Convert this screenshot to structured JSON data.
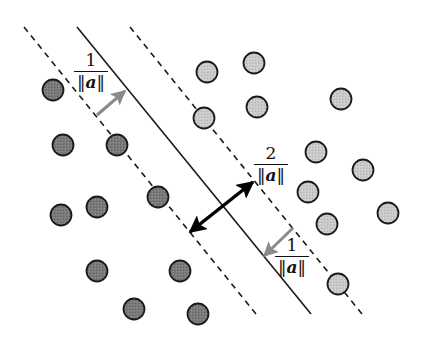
{
  "diagram": {
    "colors": {
      "class_a_fill": "#7a7a7a",
      "class_b_fill": "#c9c9c9",
      "stroke": "#1a1a1a",
      "small_arrow": "#8a8a8a",
      "margin_arrow": "#000000"
    },
    "lines": {
      "hyperplane": {
        "x1": 77,
        "y1": 27,
        "x2": 311,
        "y2": 314,
        "style": "solid"
      },
      "margin_left": {
        "x1": 24,
        "y1": 27,
        "x2": 256,
        "y2": 314,
        "style": "dashed"
      },
      "margin_right": {
        "x1": 130,
        "y1": 27,
        "x2": 362,
        "y2": 314,
        "style": "dashed"
      }
    },
    "arrows": {
      "margin_width": {
        "x1": 190,
        "y1": 232,
        "x2": 253,
        "y2": 182,
        "double": true
      },
      "left_half": {
        "x1": 97,
        "y1": 115,
        "x2": 125,
        "y2": 91
      },
      "right_half": {
        "x1": 293,
        "y1": 228,
        "x2": 264,
        "y2": 256
      }
    },
    "labels": {
      "left_half": {
        "numerator": "1",
        "denominator_pre": "‖",
        "denominator_var": "a",
        "denominator_post": "‖"
      },
      "full_margin": {
        "numerator": "2",
        "denominator_pre": "‖",
        "denominator_var": "a",
        "denominator_post": "‖"
      },
      "right_half": {
        "numerator": "1",
        "denominator_pre": "‖",
        "denominator_var": "a",
        "denominator_post": "‖"
      }
    },
    "class_a_points": [
      [
        53,
        90
      ],
      [
        63,
        145
      ],
      [
        117,
        145
      ],
      [
        158,
        197
      ],
      [
        61,
        215
      ],
      [
        97,
        207
      ],
      [
        97,
        271
      ],
      [
        180,
        271
      ],
      [
        134,
        309
      ],
      [
        198,
        314
      ]
    ],
    "class_b_points": [
      [
        207,
        72
      ],
      [
        254,
        63
      ],
      [
        204,
        118
      ],
      [
        257,
        107
      ],
      [
        341,
        99
      ],
      [
        316,
        152
      ],
      [
        363,
        170
      ],
      [
        308,
        192
      ],
      [
        327,
        224
      ],
      [
        388,
        213
      ],
      [
        338,
        284
      ]
    ],
    "point_radius": 10.5
  }
}
